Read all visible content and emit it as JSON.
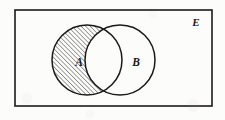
{
  "figure": {
    "kind": "venn-diagram",
    "background_color": "#fcfcfb",
    "stroke_color": "#1a1a1a"
  },
  "universe": {
    "label": "E",
    "label_x": 196,
    "label_y": 26,
    "rect": {
      "x": 15,
      "y": 10,
      "width": 197,
      "height": 96
    },
    "stroke_width": 1.6
  },
  "sets": [
    {
      "label": "A",
      "label_x": 79,
      "label_y": 66,
      "cx": 87,
      "cy": 60,
      "r": 35,
      "shaded": true,
      "hatch": {
        "angle_deg": 45,
        "spacing_px": 3.2,
        "line_width": 0.85,
        "color": "#262626"
      }
    },
    {
      "label": "B",
      "label_x": 136,
      "label_y": 66,
      "cx": 120,
      "cy": 60,
      "r": 35,
      "shaded": false
    }
  ],
  "regions": {
    "shaded_region": "A minus B",
    "intersection_shaded": false,
    "b_only_shaded": false,
    "outside_shaded": false
  },
  "stroke_width_circle": 1.5
}
